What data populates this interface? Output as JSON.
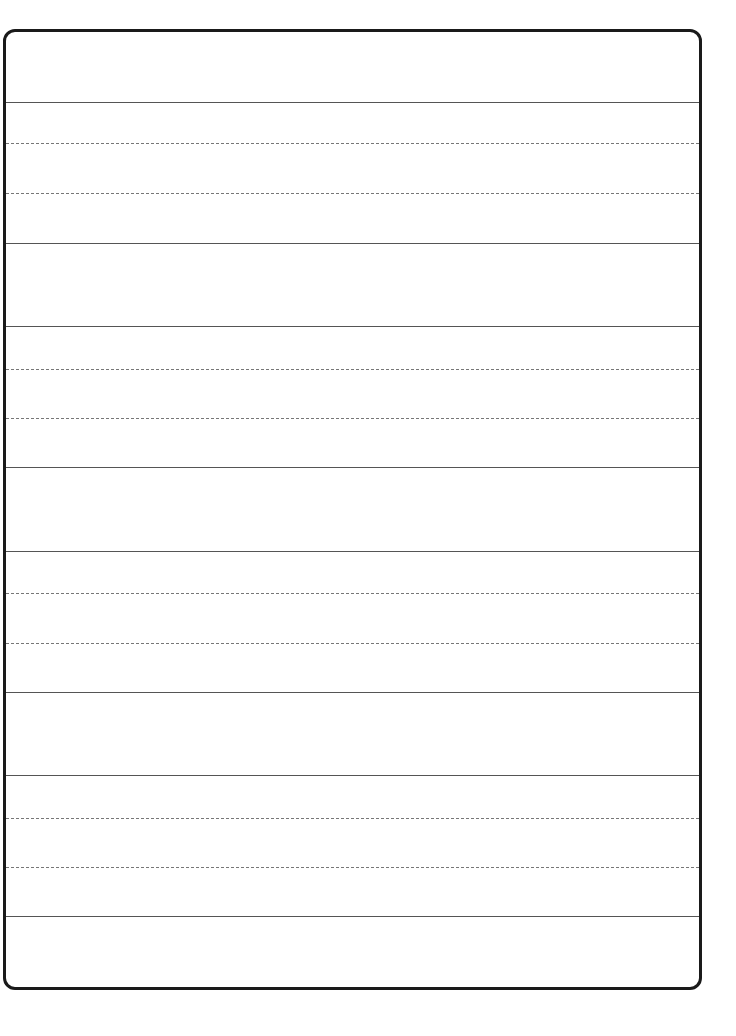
{
  "page": {
    "type": "handwriting-practice-sheet",
    "background_color": "#ffffff",
    "border_color": "#1a1a1a",
    "solid_line_color": "#555555",
    "dashed_line_color": "#777777"
  },
  "line_groups": [
    {
      "top": 102,
      "mid1": 143,
      "mid2": 193,
      "bottom": 243
    },
    {
      "top": 326,
      "mid1": 369,
      "mid2": 418,
      "bottom": 467
    },
    {
      "top": 551,
      "mid1": 593,
      "mid2": 643,
      "bottom": 692
    },
    {
      "top": 775,
      "mid1": 818,
      "mid2": 867,
      "bottom": 916
    }
  ]
}
